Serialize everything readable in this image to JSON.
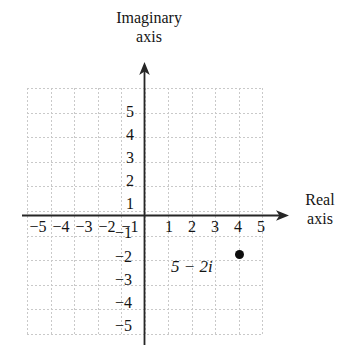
{
  "figure": {
    "kind": "complex-plane-argand-diagram",
    "background_color": "#ffffff",
    "ink_color": "#141414",
    "grid_color": "#c9c9c9",
    "point_color": "#0d0d0d"
  },
  "axes": {
    "imaginary": {
      "title_line1": "Imaginary",
      "title_line2": "axis",
      "tick_labels": [
        "5",
        "4",
        "3",
        "2",
        "1",
        "−1",
        "−2",
        "−3",
        "−4",
        "−5"
      ],
      "tick_values": [
        5,
        4,
        3,
        2,
        1,
        -1,
        -2,
        -3,
        -4,
        -5
      ],
      "range": [
        -5,
        5
      ],
      "arrow": "up"
    },
    "real": {
      "title_line1": "Real",
      "title_line2": "axis",
      "tick_labels": [
        "−5",
        "−4",
        "−3",
        "−2",
        "−1",
        "1",
        "2",
        "3",
        "4",
        "5"
      ],
      "tick_values": [
        -5,
        -4,
        -3,
        -2,
        -1,
        1,
        2,
        3,
        4,
        5
      ],
      "range": [
        -5,
        5
      ],
      "arrow": "right"
    }
  },
  "grid": {
    "visible": true,
    "style": "dotted",
    "x_range": [
      -5,
      5
    ],
    "y_range": [
      -5,
      5
    ]
  },
  "plotted_points": [
    {
      "label": "5 − 2i",
      "real": 5,
      "imaginary": -2,
      "marker": "filled-circle"
    }
  ]
}
